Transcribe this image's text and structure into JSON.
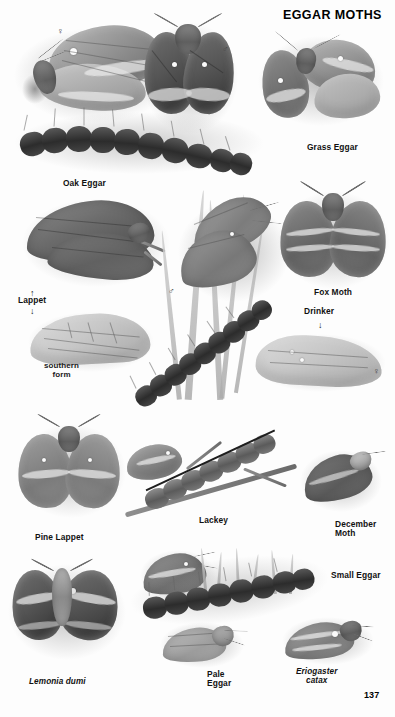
{
  "plate": {
    "title": "EGGAR MOTHS",
    "page_number": "137",
    "medium": "grayscale field-guide illustration plate"
  },
  "symbols": {
    "female": "♀",
    "male": "♂",
    "arrow_up": "↑",
    "arrow_down": "↓"
  },
  "labels": [
    {
      "id": "grass-eggar",
      "text": "Grass Eggar",
      "style": "caption"
    },
    {
      "id": "oak-eggar",
      "text": "Oak Eggar",
      "style": "caption"
    },
    {
      "id": "lappet",
      "text": "Lappet",
      "style": "caption"
    },
    {
      "id": "southern-form",
      "text": "southern\nform",
      "style": "form-note"
    },
    {
      "id": "fox-moth",
      "text": "Fox Moth",
      "style": "caption"
    },
    {
      "id": "drinker",
      "text": "Drinker",
      "style": "caption"
    },
    {
      "id": "pine-lappet",
      "text": "Pine Lappet",
      "style": "caption"
    },
    {
      "id": "lackey",
      "text": "Lackey",
      "style": "caption"
    },
    {
      "id": "december-moth",
      "text": "December\nMoth",
      "style": "caption"
    },
    {
      "id": "small-eggar",
      "text": "Small Eggar",
      "style": "caption"
    },
    {
      "id": "lemonia-dumi",
      "text": "Lemonia dumi",
      "style": "scientific"
    },
    {
      "id": "pale-eggar",
      "text": "Pale\nEggar",
      "style": "caption"
    },
    {
      "id": "eriogaster-catax",
      "text": "Eriogaster\ncatax",
      "style": "scientific"
    }
  ],
  "sex_marks": [
    {
      "id": "oak-eggar-female",
      "symbol": "♀"
    },
    {
      "id": "oak-eggar-male",
      "symbol": "♂"
    },
    {
      "id": "drinker-male",
      "symbol": "♂"
    },
    {
      "id": "drinker-female",
      "symbol": "♀"
    }
  ],
  "pointer_arrows": [
    {
      "id": "lappet-arrow-up",
      "symbol": "↑"
    },
    {
      "id": "lappet-arrow-down",
      "symbol": "↓"
    },
    {
      "id": "drinker-arrow-down",
      "symbol": "↓"
    }
  ],
  "colors": {
    "background": "#fdfdfd",
    "ink": "#111111",
    "art_mid": "#9a9a9a",
    "art_dark": "#3f3f3f",
    "art_pale": "#dcdcdc"
  }
}
